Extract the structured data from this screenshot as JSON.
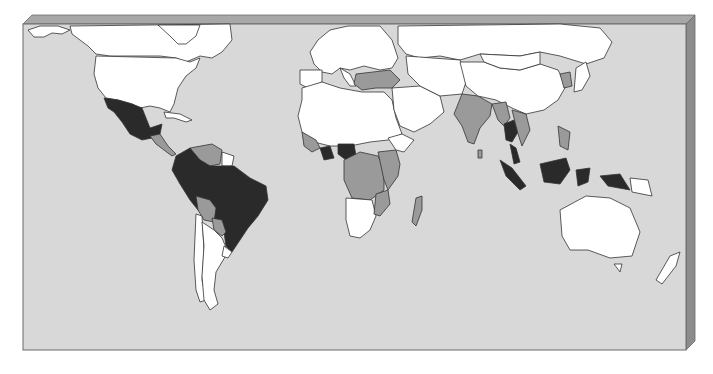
{
  "map": {
    "type": "choropleth-world-map",
    "colors": {
      "ocean": "#d8d8d8",
      "frame_top": "#a8a8a8",
      "frame_side": "#8c8c8c",
      "frame_border": "#6a6a6a",
      "category_none": "#ffffff",
      "category_medium": "#9a9a9a",
      "category_high": "#2a2a2a",
      "border": "#333333"
    },
    "legend": [],
    "regions": [
      {
        "name": "canada",
        "category": "none"
      },
      {
        "name": "alaska",
        "category": "none"
      },
      {
        "name": "greenland",
        "category": "none"
      },
      {
        "name": "united-states",
        "category": "none"
      },
      {
        "name": "mexico",
        "category": "high"
      },
      {
        "name": "cuba",
        "category": "none"
      },
      {
        "name": "central-america",
        "category": "medium"
      },
      {
        "name": "venezuela",
        "category": "medium"
      },
      {
        "name": "guianas",
        "category": "none"
      },
      {
        "name": "colombia-brazil-peru",
        "category": "high"
      },
      {
        "name": "bolivia",
        "category": "medium"
      },
      {
        "name": "paraguay",
        "category": "medium"
      },
      {
        "name": "chile",
        "category": "none"
      },
      {
        "name": "argentina",
        "category": "none"
      },
      {
        "name": "uruguay",
        "category": "none"
      },
      {
        "name": "europe",
        "category": "none"
      },
      {
        "name": "spain",
        "category": "none"
      },
      {
        "name": "italy",
        "category": "none"
      },
      {
        "name": "greece-turkey",
        "category": "medium"
      },
      {
        "name": "russia",
        "category": "none"
      },
      {
        "name": "north-africa",
        "category": "none"
      },
      {
        "name": "west-africa-coast",
        "category": "medium"
      },
      {
        "name": "ghana",
        "category": "high"
      },
      {
        "name": "nigeria",
        "category": "high"
      },
      {
        "name": "central-africa",
        "category": "medium"
      },
      {
        "name": "east-africa",
        "category": "medium"
      },
      {
        "name": "horn-of-africa",
        "category": "none"
      },
      {
        "name": "southern-africa",
        "category": "none"
      },
      {
        "name": "mozambique",
        "category": "medium"
      },
      {
        "name": "madagascar",
        "category": "medium"
      },
      {
        "name": "middle-east",
        "category": "none"
      },
      {
        "name": "central-asia",
        "category": "none"
      },
      {
        "name": "india",
        "category": "medium"
      },
      {
        "name": "sri-lanka",
        "category": "medium"
      },
      {
        "name": "china",
        "category": "none"
      },
      {
        "name": "mongolia",
        "category": "none"
      },
      {
        "name": "myanmar",
        "category": "medium"
      },
      {
        "name": "thailand",
        "category": "high"
      },
      {
        "name": "vietnam-laos",
        "category": "medium"
      },
      {
        "name": "korea",
        "category": "medium"
      },
      {
        "name": "japan",
        "category": "none"
      },
      {
        "name": "philippines",
        "category": "medium"
      },
      {
        "name": "malaysia",
        "category": "high"
      },
      {
        "name": "sumatra",
        "category": "high"
      },
      {
        "name": "borneo",
        "category": "high"
      },
      {
        "name": "sulawesi",
        "category": "high"
      },
      {
        "name": "new-guinea-west",
        "category": "high"
      },
      {
        "name": "papua-new-guinea",
        "category": "none"
      },
      {
        "name": "australia",
        "category": "none"
      },
      {
        "name": "tasmania",
        "category": "none"
      },
      {
        "name": "new-zealand",
        "category": "none"
      }
    ]
  }
}
